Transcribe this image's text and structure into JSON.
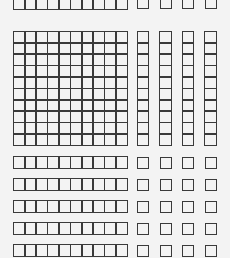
{
  "diagram": {
    "title": "",
    "kind": "base-ten blocks",
    "line_color": "#3a3a3a",
    "background_color": "#f3f3f3",
    "cell_size_px": 11.4,
    "top_row": {
      "rod_cells": 10,
      "units": 4,
      "partially_visible": true
    },
    "hundred_flat": {
      "rows": 10,
      "cols": 10
    },
    "vertical_rods": {
      "count": 4,
      "cells_each": 10
    },
    "horizontal_rod_rows": {
      "count": 5,
      "rod_cells": 10,
      "units_per_row": 4
    }
  }
}
